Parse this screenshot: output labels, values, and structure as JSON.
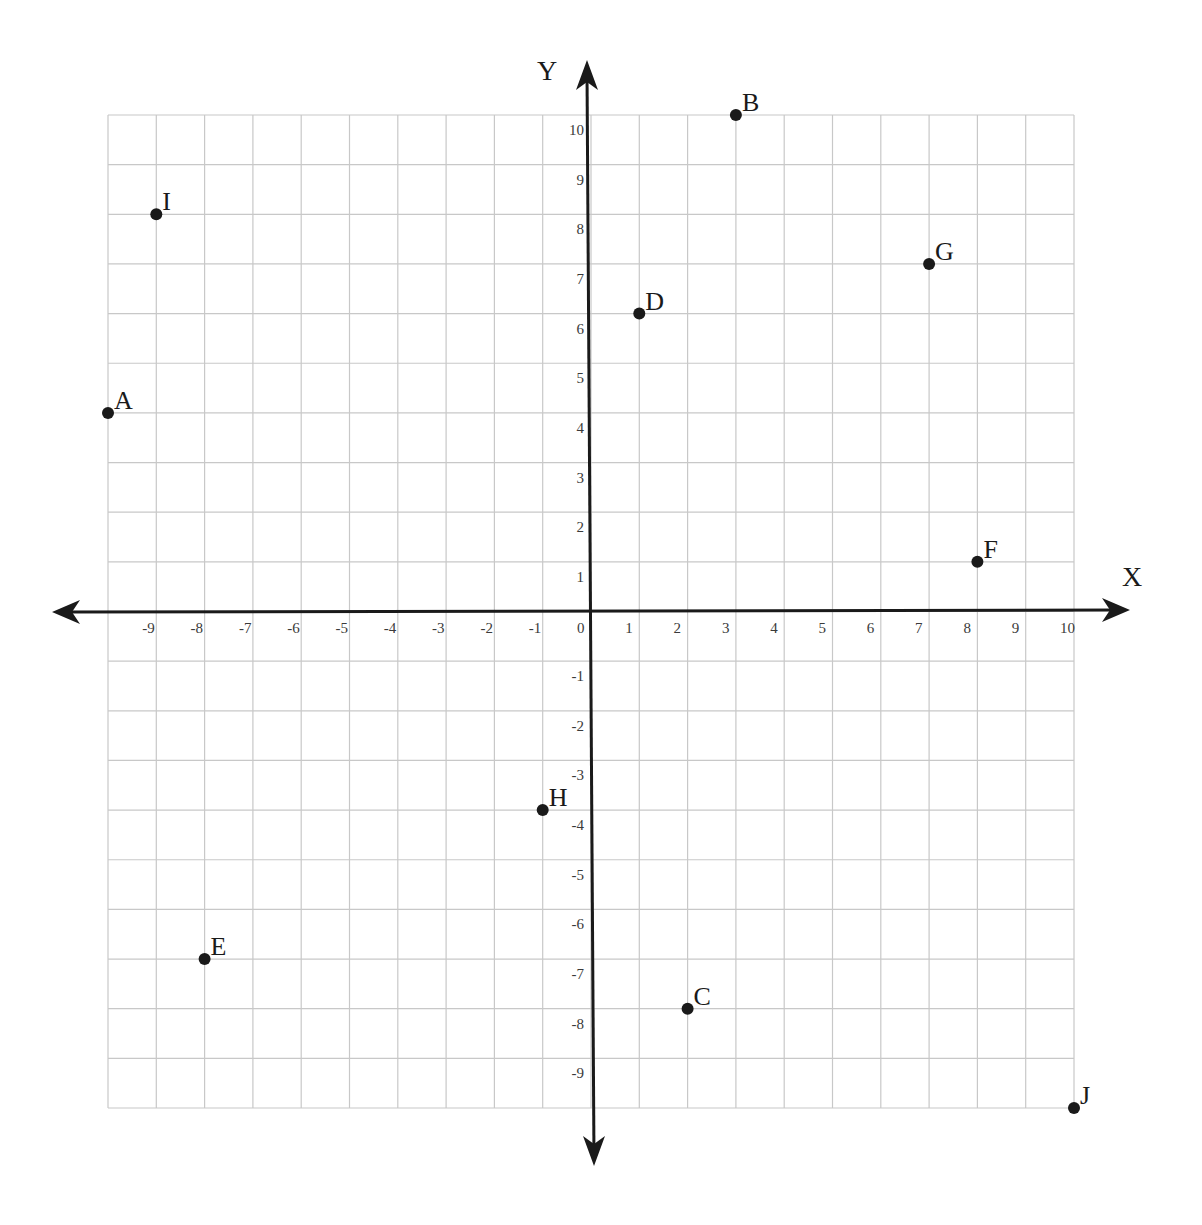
{
  "chart_data": {
    "type": "scatter",
    "title": "",
    "xlabel": "X",
    "ylabel": "Y",
    "xlim": [
      -10,
      10
    ],
    "ylim": [
      -10,
      10
    ],
    "grid": true,
    "legend": null,
    "x_tick_labels": [
      "-9",
      "-8",
      "-7",
      "-6",
      "-5",
      "-4",
      "-3",
      "-2",
      "-1",
      "0",
      "1",
      "2",
      "3",
      "4",
      "5",
      "6",
      "7",
      "8",
      "9",
      "10"
    ],
    "y_tick_labels": [
      "10",
      "9",
      "8",
      "7",
      "6",
      "5",
      "4",
      "3",
      "2",
      "1",
      "-1",
      "-2",
      "-3",
      "-4",
      "-5",
      "-6",
      "-7",
      "-8",
      "-9"
    ],
    "points": [
      {
        "label": "A",
        "x": -10,
        "y": 4
      },
      {
        "label": "B",
        "x": 3,
        "y": 10
      },
      {
        "label": "C",
        "x": 2,
        "y": -8
      },
      {
        "label": "D",
        "x": 1,
        "y": 6
      },
      {
        "label": "E",
        "x": -8,
        "y": -7
      },
      {
        "label": "F",
        "x": 8,
        "y": 1
      },
      {
        "label": "G",
        "x": 7,
        "y": 7
      },
      {
        "label": "H",
        "x": -1,
        "y": -4
      },
      {
        "label": "I",
        "x": -9,
        "y": 8
      },
      {
        "label": "J",
        "x": 10,
        "y": -10
      }
    ]
  },
  "colors": {
    "grid": "#c8c8c8",
    "axis": "#1a1a1a",
    "point": "#1a1a1a",
    "tick_text": "#3a3a3a"
  }
}
